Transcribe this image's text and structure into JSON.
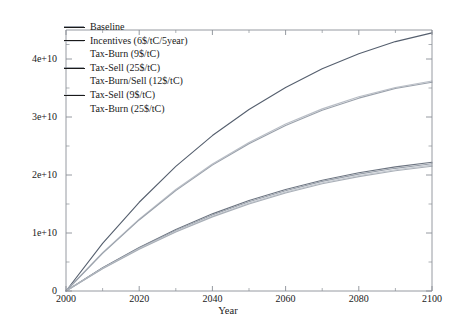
{
  "chart_data": {
    "type": "line",
    "title": "",
    "xlabel": "Year",
    "ylabel": "Carbon from Deforestation [tC]",
    "xlim": [
      2000,
      2100
    ],
    "ylim": [
      0,
      45000000000
    ],
    "grid": false,
    "legend_position": "top-left",
    "xticks": [
      2000,
      2020,
      2040,
      2060,
      2080,
      2100
    ],
    "xtick_labels": [
      "2000",
      "2020",
      "2040",
      "2060",
      "2080",
      "2100"
    ],
    "yticks": [
      0,
      10000000000,
      20000000000,
      30000000000,
      40000000000
    ],
    "ytick_labels": [
      "0",
      "1e+10",
      "2e+10",
      "3e+10",
      "4e+10"
    ],
    "x": [
      2000,
      2010,
      2020,
      2030,
      2040,
      2050,
      2060,
      2070,
      2080,
      2090,
      2100
    ],
    "series": [
      {
        "name": "Baseline",
        "color": "#555f6e",
        "show_key": true,
        "values": [
          0,
          8200000000,
          15300000000,
          21500000000,
          26800000000,
          31300000000,
          35100000000,
          38300000000,
          40900000000,
          43000000000,
          44500000000
        ]
      },
      {
        "name": "Incentives (6$/tC/5year)",
        "color": "#b9bec6",
        "show_key": true,
        "values": [
          0,
          6600000000,
          12400000000,
          17500000000,
          21900000000,
          25600000000,
          28800000000,
          31400000000,
          33500000000,
          35100000000,
          36200000000
        ]
      },
      {
        "name": "Tax-Burn (9$/tC)",
        "color": "#9aa1ab",
        "show_key": false,
        "values": [
          0,
          6500000000,
          12250000000,
          17300000000,
          21700000000,
          25400000000,
          28550000000,
          31150000000,
          33250000000,
          34900000000,
          36000000000
        ]
      },
      {
        "name": "Tax-Sell (25$/tC)",
        "color": "#6c7480",
        "show_key": true,
        "values": [
          0,
          4000000000,
          7500000000,
          10600000000,
          13300000000,
          15600000000,
          17500000000,
          19100000000,
          20400000000,
          21400000000,
          22200000000
        ]
      },
      {
        "name": "Tax-Burn/Sell (12$/tC)",
        "color": "#9aa1ab",
        "show_key": false,
        "values": [
          0,
          3950000000,
          7400000000,
          10450000000,
          13100000000,
          15400000000,
          17300000000,
          18900000000,
          20150000000,
          21150000000,
          21950000000
        ]
      },
      {
        "name": "Tax-Sell (9$/tC)",
        "color": "#c6cbd2",
        "show_key": true,
        "values": [
          0,
          3880000000,
          7280000000,
          10280000000,
          12900000000,
          15150000000,
          17050000000,
          18650000000,
          19900000000,
          20900000000,
          21700000000
        ]
      },
      {
        "name": "Tax-Burn (25$/tC)",
        "color": "#aab0b8",
        "show_key": false,
        "values": [
          0,
          3840000000,
          7200000000,
          10180000000,
          12780000000,
          15000000000,
          16900000000,
          18480000000,
          19720000000,
          20720000000,
          21500000000
        ]
      }
    ]
  },
  "axes": {
    "frame_color": "#8a8f96"
  }
}
